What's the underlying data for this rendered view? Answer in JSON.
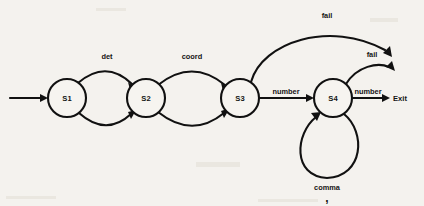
{
  "diagram": {
    "type": "state-transition-diagram",
    "background_color": "#f4f2ee",
    "stroke_color": "#111111",
    "states": [
      {
        "id": "S1",
        "label": "S1",
        "cx": 67,
        "cy": 98,
        "r": 19
      },
      {
        "id": "S2",
        "label": "S2",
        "cx": 146,
        "cy": 98,
        "r": 19
      },
      {
        "id": "S3",
        "label": "S3",
        "cx": 240,
        "cy": 98,
        "r": 19
      },
      {
        "id": "S4",
        "label": "S4",
        "cx": 333,
        "cy": 98,
        "r": 19
      }
    ],
    "terminal": {
      "id": "Exit",
      "label": "Exit",
      "x": 393,
      "y": 101
    },
    "start_arrow": {
      "from_x": 10,
      "to_x": 48,
      "y": 98
    },
    "transitions": [
      {
        "from": "S1",
        "to": "S2",
        "label": "det",
        "label_x": 107,
        "label_y": 59,
        "shape": "arc-above"
      },
      {
        "from": "S1",
        "to": "S2",
        "label": "",
        "shape": "arc-below"
      },
      {
        "from": "S2",
        "to": "S3",
        "label": "coord",
        "label_x": 192,
        "label_y": 59,
        "shape": "arc-above"
      },
      {
        "from": "S2",
        "to": "S3",
        "label": "",
        "shape": "arc-below"
      },
      {
        "from": "S3",
        "to": "S4",
        "label": "number",
        "label_x": 286,
        "label_y": 94,
        "shape": "straight"
      },
      {
        "from": "S4",
        "to": "Exit",
        "label": "number",
        "label_x": 368,
        "label_y": 94,
        "shape": "straight"
      },
      {
        "from": "S3",
        "to": "Exit",
        "label": "fail",
        "label_x": 327,
        "label_y": 18,
        "shape": "long-arc-above"
      },
      {
        "from": "S4",
        "to": "Exit",
        "label": "fail",
        "label_x": 372,
        "label_y": 57,
        "shape": "short-arc-above"
      },
      {
        "from": "S4",
        "to": "S4",
        "label": "comma",
        "label_x": 327,
        "label_y": 190,
        "shape": "self-loop-below",
        "glyph": ",",
        "glyph_x": 327,
        "glyph_y": 202
      }
    ]
  }
}
